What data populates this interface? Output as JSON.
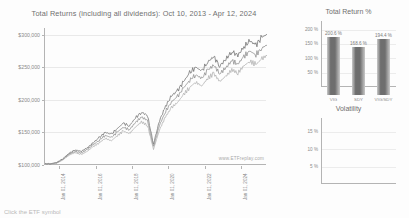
{
  "main": {
    "title": "Total Returns (including all dividends): Oct 10, 2013 - Apr 12, 2024",
    "watermark": "www.ETFreplay.com",
    "y_ticks": [
      "$300,000",
      "$250,000",
      "$200,000",
      "$150,000",
      "$100,000"
    ],
    "x_ticks": [
      "Jan 01, 2014",
      "Jan 01, 2016",
      "Jan 01, 2018",
      "Jan 01, 2020",
      "Jan 01, 2022",
      "Jan 01, 2024"
    ]
  },
  "total_return_panel": {
    "title": "Total Return %",
    "y_ticks": [
      "200 %",
      "150 %",
      "100 %",
      "50 %"
    ],
    "categories": [
      "VIG",
      "SDY",
      "VIG/SDY"
    ],
    "values_text": [
      "200.6 %",
      "168.6 %",
      "194.4 %"
    ]
  },
  "volatility_panel": {
    "title": "Volatility",
    "y_ticks": [
      "15 %",
      "10 %",
      "5 %"
    ],
    "categories": [
      "VIG",
      "SDY",
      "VIG/SDY"
    ],
    "values_text": [
      "15.6 %",
      "16.4 %",
      "16.1 %"
    ]
  },
  "caption": "Click the ETF symbol",
  "colors": {
    "series_a": "#8d8d8d",
    "series_b": "#b0b0b0",
    "series_c": "#6f6f6f",
    "axis": "#b4b4b4",
    "grid": "#e9e9e9",
    "text": "#6f6f6f",
    "bar_dark": "#6e6e6e",
    "bar_light": "#c9c9c9"
  },
  "chart_data": [
    {
      "type": "line",
      "title": "Total Returns (including all dividends): Oct 10, 2013 - Apr 12, 2024",
      "xlabel": "",
      "ylabel": "",
      "ylim": [
        100000,
        310000
      ],
      "grid": true,
      "legend": "none",
      "x": [
        "Jan 01, 2014",
        "Jan 01, 2016",
        "Jan 01, 2018",
        "Jan 01, 2020",
        "Jan 01, 2022",
        "Jan 01, 2024"
      ],
      "series": [
        {
          "name": "VIG",
          "values": [
            102000,
            104000,
            110000,
            118000,
            123000,
            121000,
            126000,
            134000,
            142000,
            150000,
            147000,
            156000,
            164000,
            160000,
            172000,
            181000,
            176000,
            132000,
            168000,
            190000,
            206000,
            214000,
            228000,
            241000,
            250000,
            244000,
            258000,
            266000,
            252000,
            262000,
            274000,
            268000,
            281000,
            290000,
            284000,
            296000,
            301000
          ]
        },
        {
          "name": "SDY",
          "values": [
            101500,
            103000,
            108000,
            115000,
            119000,
            116000,
            121000,
            128000,
            134000,
            141000,
            137000,
            145000,
            152000,
            148000,
            158000,
            166000,
            161000,
            124000,
            154000,
            174000,
            188000,
            196000,
            208000,
            219000,
            227000,
            221000,
            233000,
            240000,
            228000,
            236000,
            246000,
            241000,
            252000,
            259000,
            254000,
            263000,
            269000
          ]
        },
        {
          "name": "VIG/SDY",
          "values": [
            101800,
            103500,
            109000,
            116500,
            121000,
            118500,
            123500,
            131000,
            138000,
            145500,
            142000,
            150500,
            158000,
            154000,
            165000,
            173500,
            168500,
            128000,
            161000,
            182000,
            197000,
            205000,
            218000,
            230000,
            238500,
            232500,
            245500,
            253000,
            240000,
            249000,
            260000,
            254500,
            266500,
            274500,
            269000,
            279500,
            285000
          ]
        }
      ]
    },
    {
      "type": "bar",
      "title": "Total Return %",
      "categories": [
        "VIG",
        "SDY",
        "VIG/SDY"
      ],
      "values": [
        200.6,
        168.6,
        194.4
      ],
      "xlabel": "",
      "ylabel": "",
      "ylim": [
        0,
        230
      ],
      "grid": true
    },
    {
      "type": "bar",
      "title": "Volatility",
      "categories": [
        "VIG",
        "SDY",
        "VIG/SDY"
      ],
      "values": [
        15.6,
        16.4,
        16.1
      ],
      "xlabel": "",
      "ylabel": "",
      "ylim": [
        0,
        19
      ],
      "grid": true
    }
  ]
}
